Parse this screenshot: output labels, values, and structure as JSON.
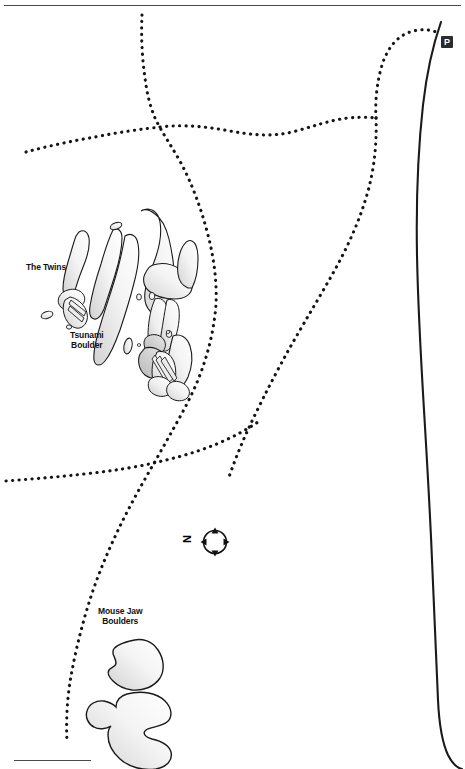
{
  "map": {
    "title": "Bouldering Area Map",
    "background_color": "#ffffff",
    "width": 465,
    "height": 769,
    "line_color": "#1a1a1a",
    "boulder_fill_light": "#ffffff",
    "boulder_fill_dark": "#d4d4d4",
    "boulder_stroke": "#1a1a1a"
  },
  "labels": {
    "the_twins": "The Twins",
    "tsunami_boulder_line1": "Tsunami",
    "tsunami_boulder_line2": "Boulder",
    "mouse_jaw_line1": "Mouse Jaw",
    "mouse_jaw_line2": "Boulders"
  },
  "compass": {
    "north_letter": "N",
    "orientation_note": "rotated"
  },
  "markers": {
    "parking_letter": "P"
  },
  "header": {
    "cropped_text": "Map area"
  },
  "features": {
    "trails": [
      {
        "name": "main-trail-north",
        "style": "dotted"
      },
      {
        "name": "trail-junction-west-spur",
        "style": "dotted"
      },
      {
        "name": "trail-east-to-parking",
        "style": "dotted"
      },
      {
        "name": "trail-south-descent",
        "style": "dotted"
      },
      {
        "name": "trail-west-horizontal",
        "style": "dotted"
      },
      {
        "name": "trail-east-loop",
        "style": "dotted"
      }
    ],
    "roads": [
      {
        "name": "access-road",
        "style": "solid"
      }
    ],
    "boulder_groups": [
      {
        "name": "the-twins",
        "count": 2
      },
      {
        "name": "tsunami-boulder-cluster",
        "count": 12
      },
      {
        "name": "mouse-jaw-boulders",
        "count": 2
      }
    ]
  }
}
